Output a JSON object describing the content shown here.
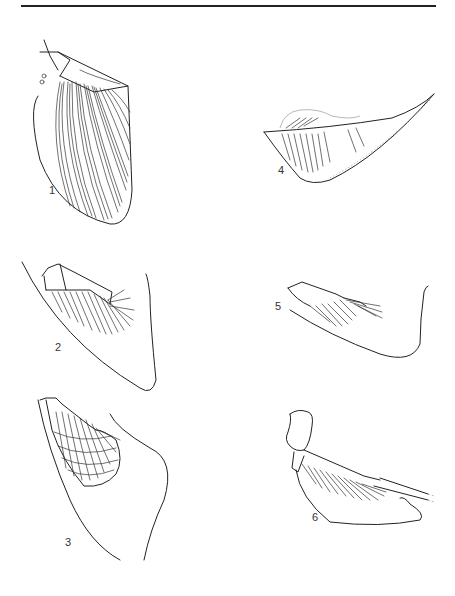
{
  "figure": {
    "panels": [
      {
        "id": "1",
        "label": "1",
        "description": "fan-shaped fin with many radiating rays"
      },
      {
        "id": "2",
        "label": "2",
        "description": "fin with short radials and fan of rays, large outline"
      },
      {
        "id": "3",
        "label": "3",
        "description": "fin with cellular radial pattern and outline"
      },
      {
        "id": "4",
        "label": "4",
        "description": "elongated wedge-shaped fin with parallel rays"
      },
      {
        "id": "5",
        "label": "5",
        "description": "small fin with radials and rays, outline"
      },
      {
        "id": "6",
        "label": "6",
        "description": "fin with scapular bone, hatched rays, outline"
      }
    ]
  }
}
